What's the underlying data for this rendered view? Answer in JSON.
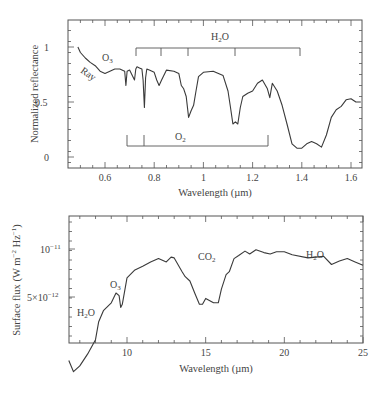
{
  "chart_data": [
    {
      "type": "line",
      "title": "",
      "xlabel": "Wavelength (µm)",
      "ylabel": "Normalized reflectance",
      "xlim": [
        0.45,
        1.645
      ],
      "ylim": [
        -0.1,
        1.25
      ],
      "xticks": [
        0.6,
        0.8,
        1,
        1.2,
        1.4,
        1.6
      ],
      "xtick_labels": [
        "0.6",
        "0.8",
        "1",
        "1.2",
        "1.4",
        "1.6"
      ],
      "yticks": [
        0,
        0.5,
        1
      ],
      "ytick_labels": [
        "0",
        "0.5",
        "1"
      ],
      "grid": false,
      "series": [
        {
          "name": "Earth reflectance spectrum",
          "x": [
            0.49,
            0.5,
            0.52,
            0.54,
            0.56,
            0.58,
            0.6,
            0.62,
            0.64,
            0.66,
            0.68,
            0.685,
            0.69,
            0.7,
            0.72,
            0.725,
            0.73,
            0.74,
            0.75,
            0.755,
            0.76,
            0.765,
            0.77,
            0.78,
            0.8,
            0.81,
            0.82,
            0.83,
            0.85,
            0.88,
            0.9,
            0.91,
            0.92,
            0.93,
            0.94,
            0.95,
            0.96,
            0.97,
            0.98,
            1.0,
            1.04,
            1.08,
            1.1,
            1.11,
            1.12,
            1.13,
            1.14,
            1.15,
            1.16,
            1.18,
            1.2,
            1.22,
            1.24,
            1.26,
            1.27,
            1.28,
            1.3,
            1.32,
            1.34,
            1.36,
            1.38,
            1.4,
            1.42,
            1.44,
            1.46,
            1.48,
            1.5,
            1.52,
            1.54,
            1.56,
            1.58,
            1.6,
            1.62,
            1.64
          ],
          "y": [
            1.0,
            0.95,
            0.9,
            0.86,
            0.83,
            0.78,
            0.76,
            0.78,
            0.8,
            0.8,
            0.78,
            0.65,
            0.78,
            0.79,
            0.7,
            0.8,
            0.82,
            0.81,
            0.8,
            0.7,
            0.45,
            0.72,
            0.8,
            0.79,
            0.77,
            0.7,
            0.65,
            0.7,
            0.79,
            0.78,
            0.76,
            0.65,
            0.62,
            0.55,
            0.36,
            0.42,
            0.47,
            0.6,
            0.73,
            0.77,
            0.78,
            0.74,
            0.6,
            0.45,
            0.3,
            0.32,
            0.3,
            0.45,
            0.55,
            0.58,
            0.6,
            0.67,
            0.7,
            0.62,
            0.54,
            0.67,
            0.6,
            0.47,
            0.3,
            0.12,
            0.08,
            0.08,
            0.12,
            0.14,
            0.12,
            0.09,
            0.2,
            0.36,
            0.43,
            0.46,
            0.52,
            0.53,
            0.5,
            0.5
          ]
        }
      ],
      "annotations": [
        {
          "text": "O3",
          "x": 0.61,
          "y": 0.89
        },
        {
          "text": "Ray",
          "x": 0.53,
          "y": 0.77,
          "rotation": 35
        },
        {
          "text": "H2O",
          "bracket_y": 1.0,
          "bracket_x": [
            0.725,
            1.395
          ],
          "bracket_ticks": [
            0.725,
            0.825,
            0.935,
            1.13,
            1.395
          ]
        },
        {
          "text": "O2",
          "bracket_y": 0.1,
          "bracket_x": [
            0.687,
            1.268
          ],
          "bracket_ticks": [
            0.687,
            0.76,
            1.268
          ]
        }
      ]
    },
    {
      "type": "line",
      "title": "",
      "xlabel": "Wavelength (µm)",
      "ylabel": "Surface flux (W m^-2 Hz^-1)",
      "xlim": [
        6.3,
        25
      ],
      "ylim": [
        1.2e-12,
        1.4e-11
      ],
      "xticks": [
        10,
        15,
        20,
        25
      ],
      "xtick_labels": [
        "10",
        "15",
        "20",
        "25"
      ],
      "yticks": [
        5e-12,
        1e-11
      ],
      "ytick_labels": [
        "5×10^-12",
        "10^-11"
      ],
      "grid": false,
      "series": [
        {
          "name": "Earth thermal emission",
          "x": [
            6.3,
            6.6,
            7.0,
            7.5,
            8.0,
            8.2,
            8.5,
            9.0,
            9.3,
            9.5,
            9.6,
            9.7,
            10.0,
            10.5,
            11.0,
            11.5,
            12.0,
            12.5,
            12.8,
            13.0,
            13.5,
            13.7,
            14.0,
            14.3,
            14.6,
            14.8,
            15.0,
            15.5,
            15.8,
            16.0,
            16.3,
            16.5,
            16.8,
            17.1,
            17.5,
            17.8,
            18.2,
            18.7,
            19.1,
            19.5,
            20.0,
            20.5,
            21.5,
            22.0,
            22.5,
            23.0,
            23.5,
            24.0,
            24.5,
            25.0
          ],
          "y": [
            2e-12,
            1.7e-12,
            1.85e-12,
            2.2e-12,
            2.7e-12,
            3.5e-12,
            4.1e-12,
            4.6e-12,
            5.3e-12,
            5.1e-12,
            4.3e-12,
            4.5e-12,
            6.6e-12,
            7.4e-12,
            7.8e-12,
            8.3e-12,
            8.7e-12,
            8.3e-12,
            8.9e-12,
            8.8e-12,
            7.2e-12,
            6.7e-12,
            6.3e-12,
            5.3e-12,
            4.5e-12,
            4.5e-12,
            4.9e-12,
            4.6e-12,
            4.6e-12,
            5.6e-12,
            6.9e-12,
            7.2e-12,
            8.7e-12,
            9.1e-12,
            9.7e-12,
            9.3e-12,
            9.9e-12,
            9.5e-12,
            9.3e-12,
            9.6e-12,
            9.6e-12,
            9.2e-12,
            8.8e-12,
            8.9e-12,
            9e-12,
            8e-12,
            8.4e-12,
            8.7e-12,
            8.3e-12,
            7.9e-12
          ]
        }
      ],
      "annotations": [
        {
          "text": "H2O",
          "x": 7.0,
          "y": 3.8e-12
        },
        {
          "text": "O3",
          "x": 9.1,
          "y": 6e-12
        },
        {
          "text": "CO2",
          "x": 14.3,
          "y": 9.5e-12
        },
        {
          "text": "H2O",
          "x": 21.6,
          "y": 9.7e-12
        }
      ]
    }
  ],
  "top_chart": {
    "ylabel": "Normalized reflectance",
    "xlabel": "Wavelength (µm)",
    "xtick_labels": [
      "0.6",
      "0.8",
      "1",
      "1.2",
      "1.4",
      "1.6"
    ],
    "ytick_labels": [
      "1",
      "0.5",
      "0"
    ],
    "annotations": {
      "o3": "O",
      "o3_sub": "3",
      "ray": "Ray",
      "h2o": "H",
      "h2o_sub": "2",
      "h2o_tail": "O",
      "o2": "O",
      "o2_sub": "2"
    }
  },
  "bottom_chart": {
    "ylabel": "Surface flux (W m",
    "ylabel_sup1": "−2",
    "ylabel_mid": " Hz",
    "ylabel_sup2": "−1",
    "ylabel_end": ")",
    "xlabel": "Wavelength (µm)",
    "xtick_labels": [
      "10",
      "15",
      "20",
      "25"
    ],
    "ytick_1e11_base": "10",
    "ytick_1e11_exp": "−11",
    "ytick_5e12_base": "5×10",
    "ytick_5e12_exp": "−12",
    "annotations": {
      "h2o_left": "H",
      "h2o_left_sub": "2",
      "h2o_left_tail": "O",
      "o3": "O",
      "o3_sub": "3",
      "co2": "CO",
      "co2_sub": "2",
      "h2o_right": "H",
      "h2o_right_sub": "2",
      "h2o_right_tail": "O"
    }
  },
  "colors": {
    "line": "#3a3a3a",
    "axis": "#555555",
    "text": "#444444",
    "background": "#ffffff"
  }
}
